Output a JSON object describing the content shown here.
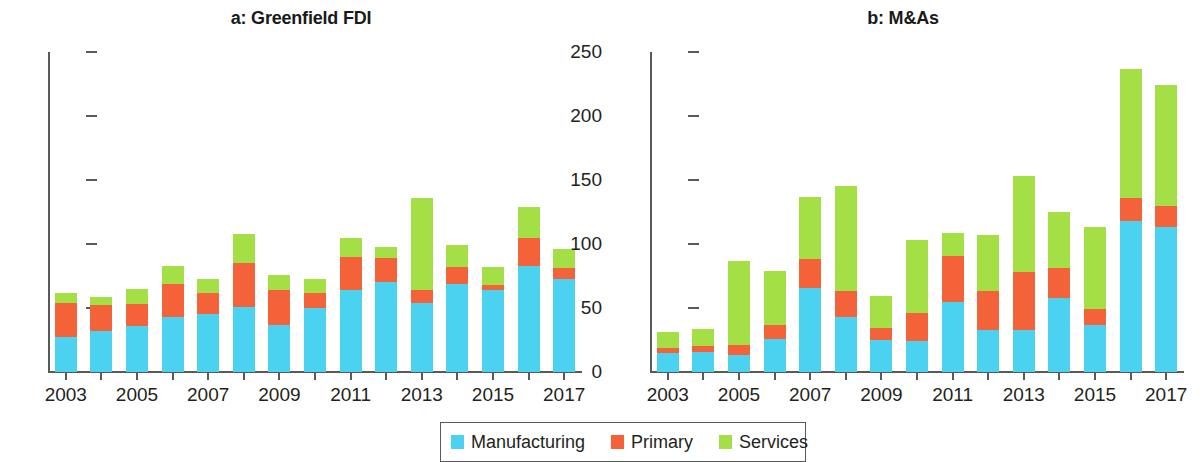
{
  "figure": {
    "panels": [
      {
        "id": "a",
        "title": "a: Greenfield FDI"
      },
      {
        "id": "b",
        "title": "b: M&As"
      }
    ]
  },
  "legend": {
    "items": [
      {
        "label": "Manufacturing",
        "color": "#4ad2f0"
      },
      {
        "label": "Primary",
        "color": "#f4623a"
      },
      {
        "label": "Services",
        "color": "#a4df46"
      }
    ]
  },
  "colors": {
    "manufacturing": "#4ad2f0",
    "primary": "#f4623a",
    "services": "#a4df46",
    "axis": "#58595b",
    "text": "#231f20",
    "background": "#ffffff"
  },
  "chart_data": [
    {
      "type": "bar",
      "stacked": true,
      "title": "a: Greenfield FDI",
      "xlabel": "",
      "ylabel": "",
      "ylim": [
        0,
        250
      ],
      "yticks": [
        0,
        50,
        100,
        150,
        200,
        250
      ],
      "grid": false,
      "legend_position": "bottom-center",
      "x": [
        2003,
        2004,
        2005,
        2006,
        2007,
        2008,
        2009,
        2010,
        2011,
        2012,
        2013,
        2014,
        2015,
        2016,
        2017
      ],
      "categories": [
        "2003",
        "2004",
        "2005",
        "2006",
        "2007",
        "2008",
        "2009",
        "2010",
        "2011",
        "2012",
        "2013",
        "2014",
        "2015",
        "2016",
        "2017"
      ],
      "tick_labels": [
        "2003",
        "",
        "2005",
        "",
        "2007",
        "",
        "2009",
        "",
        "2011",
        "",
        "2013",
        "",
        "2015",
        "",
        "2017"
      ],
      "series": [
        {
          "name": "Manufacturing",
          "color": "#4ad2f0",
          "values": [
            27,
            32,
            36,
            43,
            45,
            51,
            37,
            50,
            64,
            70,
            54,
            69,
            64,
            83,
            73
          ]
        },
        {
          "name": "Primary",
          "color": "#f4623a",
          "values": [
            27,
            20,
            17,
            26,
            17,
            34,
            27,
            12,
            26,
            19,
            10,
            13,
            4,
            22,
            8
          ]
        },
        {
          "name": "Services",
          "color": "#a4df46",
          "values": [
            8,
            7,
            12,
            14,
            11,
            23,
            12,
            11,
            15,
            9,
            72,
            17,
            14,
            24,
            15
          ]
        }
      ],
      "totals": [
        62,
        59,
        65,
        83,
        73,
        108,
        76,
        73,
        105,
        98,
        136,
        99,
        82,
        129,
        96
      ]
    },
    {
      "type": "bar",
      "stacked": true,
      "title": "b: M&As",
      "xlabel": "",
      "ylabel": "",
      "ylim": [
        0,
        250
      ],
      "yticks": [
        0,
        50,
        100,
        150,
        200,
        250
      ],
      "grid": false,
      "legend_position": "bottom-center",
      "x": [
        2003,
        2004,
        2005,
        2006,
        2007,
        2008,
        2009,
        2010,
        2011,
        2012,
        2013,
        2014,
        2015,
        2016,
        2017
      ],
      "categories": [
        "2003",
        "2004",
        "2005",
        "2006",
        "2007",
        "2008",
        "2009",
        "2010",
        "2011",
        "2012",
        "2013",
        "2014",
        "2015",
        "2016",
        "2017"
      ],
      "tick_labels": [
        "2003",
        "",
        "2005",
        "",
        "2007",
        "",
        "2009",
        "",
        "2011",
        "",
        "2013",
        "",
        "2015",
        "",
        "2017"
      ],
      "series": [
        {
          "name": "Manufacturing",
          "color": "#4ad2f0",
          "values": [
            15,
            16,
            13,
            26,
            66,
            43,
            25,
            24,
            55,
            33,
            33,
            58,
            37,
            118,
            113
          ]
        },
        {
          "name": "Primary",
          "color": "#f4623a",
          "values": [
            4,
            4,
            8,
            11,
            22,
            20,
            9,
            22,
            36,
            30,
            45,
            23,
            12,
            18,
            17
          ]
        },
        {
          "name": "Services",
          "color": "#a4df46",
          "values": [
            12,
            14,
            66,
            42,
            49,
            82,
            25,
            57,
            18,
            44,
            75,
            44,
            64,
            101,
            94
          ]
        }
      ],
      "totals": [
        31,
        34,
        87,
        79,
        137,
        145,
        59,
        103,
        109,
        107,
        153,
        125,
        113,
        237,
        224
      ]
    }
  ]
}
